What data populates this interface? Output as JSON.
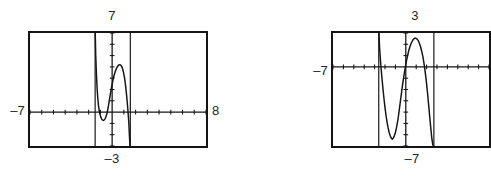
{
  "page": {
    "background_color": "#ffffff",
    "ink_color": "#141414",
    "width": 487,
    "height": 178
  },
  "figures": [
    {
      "id": "figure-one",
      "name": "graphing-calculator-screen-1",
      "labels": {
        "ymax": "7",
        "ymin": "–3",
        "xmin": "–7",
        "xmax": "8"
      }
    },
    {
      "id": "figure-two",
      "name": "graphing-calculator-screen-2",
      "labels": {
        "ymax": "3",
        "ymin": "–7",
        "xmin": "–7",
        "xmax": ""
      }
    }
  ],
  "chart_data": [
    {
      "type": "line",
      "title": "",
      "xlabel": "",
      "ylabel": "",
      "xlim": [
        -7,
        8
      ],
      "ylim": [
        -3,
        7
      ],
      "grid": false,
      "legend": "none",
      "tick_spacing": {
        "x": 1,
        "y": 1
      },
      "annotations": [
        "window Xmin = -7",
        "window Xmax = 8",
        "window Ymin = -3",
        "window Ymax = 7"
      ],
      "asymptotes": [
        -1.45,
        1.55
      ],
      "series": [
        {
          "name": "curve",
          "x": [
            -1.44,
            -1.4,
            -1.34,
            -1.28,
            -1.22,
            -1.16,
            -1.1,
            -1.04,
            -0.98,
            -0.92,
            -0.86,
            -0.8,
            -0.74,
            -0.68,
            -0.62,
            -0.56,
            -0.5,
            -0.44,
            -0.38,
            -0.32,
            -0.26,
            -0.2,
            -0.14,
            -0.08,
            -0.02,
            0.04,
            0.1,
            0.16,
            0.22,
            0.28,
            0.34,
            0.4,
            0.46,
            0.52,
            0.58,
            0.64,
            0.7,
            0.76,
            0.82,
            0.88,
            0.94,
            1.0,
            1.06,
            1.12,
            1.18,
            1.24,
            1.3,
            1.36,
            1.42,
            1.48,
            1.52
          ],
          "y": [
            7.0,
            5.1,
            3.4,
            2.1,
            1.2,
            0.55,
            0.12,
            -0.18,
            -0.4,
            -0.55,
            -0.66,
            -0.72,
            -0.74,
            -0.7,
            -0.62,
            -0.5,
            -0.32,
            -0.1,
            0.18,
            0.52,
            0.9,
            1.28,
            1.66,
            2.02,
            2.36,
            2.68,
            2.96,
            3.22,
            3.44,
            3.64,
            3.8,
            3.94,
            4.04,
            4.12,
            4.18,
            4.2,
            4.18,
            4.12,
            4.02,
            3.86,
            3.64,
            3.36,
            3.0,
            2.56,
            2.04,
            1.42,
            0.72,
            -0.06,
            -0.92,
            -2.2,
            -3.0
          ]
        }
      ]
    },
    {
      "type": "line",
      "title": "",
      "xlabel": "",
      "ylabel": "",
      "xlim": [
        -7,
        8
      ],
      "ylim": [
        -7,
        3
      ],
      "grid": false,
      "legend": "none",
      "tick_spacing": {
        "x": 1,
        "y": 1
      },
      "annotations": [
        "window Xmin = -7",
        "window Ymin = -7",
        "window Ymax = 3"
      ],
      "asymptotes": [
        -2.6,
        2.7
      ],
      "series": [
        {
          "name": "curve",
          "x": [
            -2.58,
            -2.52,
            -2.44,
            -2.36,
            -2.28,
            -2.2,
            -2.1,
            -2.0,
            -1.9,
            -1.8,
            -1.7,
            -1.6,
            -1.5,
            -1.4,
            -1.3,
            -1.2,
            -1.1,
            -1.0,
            -0.9,
            -0.8,
            -0.7,
            -0.6,
            -0.5,
            -0.4,
            -0.3,
            -0.2,
            -0.1,
            0.0,
            0.1,
            0.2,
            0.3,
            0.4,
            0.5,
            0.6,
            0.7,
            0.8,
            0.9,
            1.0,
            1.1,
            1.2,
            1.3,
            1.4,
            1.5,
            1.6,
            1.7,
            1.8,
            1.9,
            2.0,
            2.1,
            2.2,
            2.3,
            2.4,
            2.5,
            2.6,
            2.68
          ],
          "y": [
            3.0,
            1.7,
            0.6,
            -0.3,
            -1.1,
            -1.9,
            -2.8,
            -3.6,
            -4.3,
            -4.9,
            -5.4,
            -5.8,
            -6.1,
            -6.3,
            -6.4,
            -6.3,
            -6.1,
            -5.8,
            -5.4,
            -4.9,
            -4.3,
            -3.6,
            -2.9,
            -2.2,
            -1.5,
            -0.9,
            -0.3,
            0.2,
            0.7,
            1.1,
            1.5,
            1.8,
            2.05,
            2.25,
            2.4,
            2.5,
            2.55,
            2.52,
            2.45,
            2.32,
            2.12,
            1.85,
            1.5,
            1.1,
            0.6,
            0.0,
            -0.7,
            -1.5,
            -2.4,
            -3.4,
            -4.4,
            -5.4,
            -6.3,
            -6.9,
            -7.0
          ]
        }
      ]
    }
  ]
}
